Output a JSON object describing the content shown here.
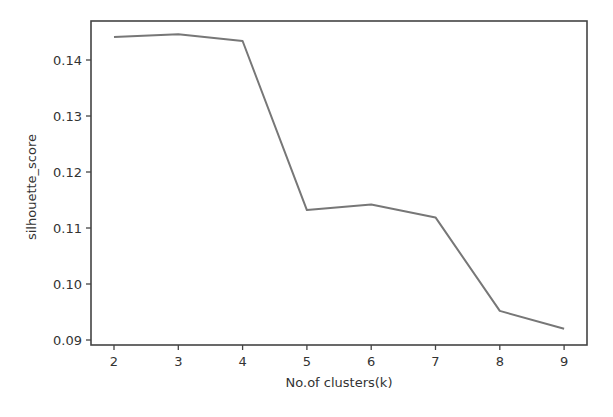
{
  "chart_data": {
    "type": "line",
    "title": "",
    "xlabel": "No.of clusters(k)",
    "ylabel": "silhouette_score",
    "x": [
      2,
      3,
      4,
      5,
      6,
      7,
      8,
      9
    ],
    "categories": [
      "2",
      "3",
      "4",
      "5",
      "6",
      "7",
      "8",
      "9"
    ],
    "series": [
      {
        "name": "silhouette_score",
        "values": [
          0.1441,
          0.1446,
          0.1434,
          0.1132,
          0.1142,
          0.1119,
          0.0952,
          0.092
        ],
        "color": "#777777"
      }
    ],
    "xticks": [
      "2",
      "3",
      "4",
      "5",
      "6",
      "7",
      "8",
      "9"
    ],
    "yticks": [
      "0.09",
      "0.10",
      "0.11",
      "0.12",
      "0.13",
      "0.14"
    ],
    "xlim": [
      1.8,
      9.35
    ],
    "ylim": [
      0.0891,
      0.1469
    ],
    "grid": false,
    "legend": null
  }
}
